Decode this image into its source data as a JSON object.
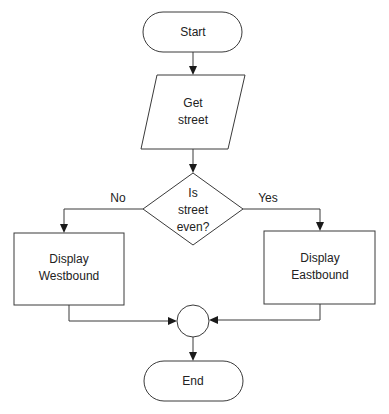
{
  "diagram": {
    "type": "flowchart",
    "nodes": {
      "start": {
        "label": "Start",
        "shape": "terminator"
      },
      "input": {
        "label": "Get\nstreet",
        "shape": "parallelogram"
      },
      "decision": {
        "label": "Is\nstreet\neven?",
        "shape": "diamond"
      },
      "west": {
        "label": "Display\nWestbound",
        "shape": "rectangle"
      },
      "east": {
        "label": "Display\nEastbound",
        "shape": "rectangle"
      },
      "connector": {
        "label": "",
        "shape": "circle"
      },
      "end": {
        "label": "End",
        "shape": "terminator"
      }
    },
    "edges": {
      "no_label": "No",
      "yes_label": "Yes"
    },
    "colors": {
      "stroke": "#3a3a3a",
      "fill": "#ffffff",
      "text": "#222222"
    }
  }
}
